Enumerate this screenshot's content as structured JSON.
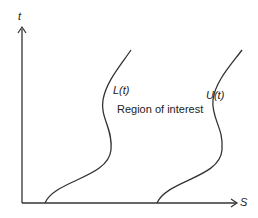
{
  "diagram": {
    "title": "",
    "axes": {
      "x_label": "S",
      "y_label": "t"
    },
    "curves": [
      {
        "name": "lower-bound",
        "label": "L(t)"
      },
      {
        "name": "upper-bound",
        "label": "U(t)"
      }
    ],
    "region_label": "Region of interest",
    "colors": {
      "line": "#333333",
      "background": "#ffffff"
    }
  }
}
